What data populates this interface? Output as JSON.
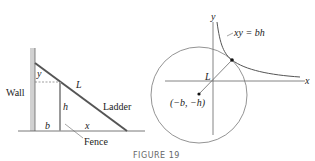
{
  "left_panel": {
    "wall_label": "Wall",
    "ladder_label": "Ladder",
    "fence_label": "Fence",
    "var_y": "y",
    "var_L": "L",
    "var_h": "h",
    "var_b": "b",
    "var_x": "x"
  },
  "right_panel": {
    "axis_x": "x",
    "axis_y": "y",
    "curve_label": "xy = bh",
    "segment_label": "L",
    "center_label": "(−b, −h)"
  },
  "caption": "FIGURE 19"
}
